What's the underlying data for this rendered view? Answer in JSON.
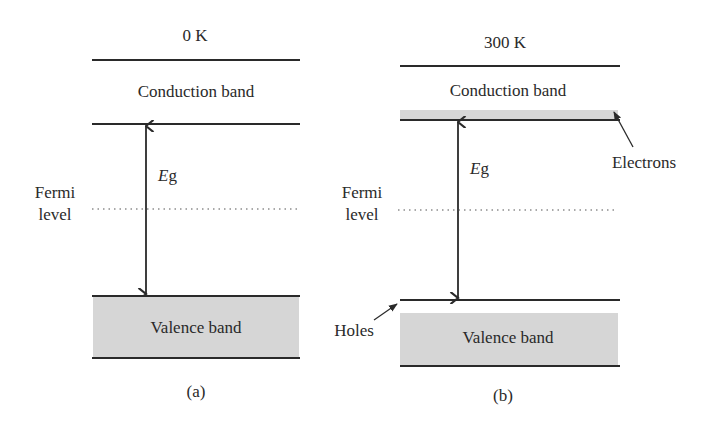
{
  "diagram": {
    "type": "energy-band-diagram",
    "panels": [
      {
        "id": "a",
        "temperature": "0 K",
        "conduction_label": "Conduction band",
        "valence_label": "Valence band",
        "gap_label_italic": "E",
        "gap_label_sub": "g",
        "fermi_label_line1": "Fermi",
        "fermi_label_line2": "level",
        "caption": "(a)"
      },
      {
        "id": "b",
        "temperature": "300 K",
        "conduction_label": "Conduction band",
        "valence_label": "Valence band",
        "gap_label_italic": "E",
        "gap_label_sub": "g",
        "fermi_label_line1": "Fermi",
        "fermi_label_line2": "level",
        "electrons_label": "Electrons",
        "holes_label": "Holes",
        "caption": "(b)"
      }
    ],
    "colors": {
      "line": "#2a2a2a",
      "band_fill": "#d6d6d6",
      "background": "#ffffff"
    }
  }
}
